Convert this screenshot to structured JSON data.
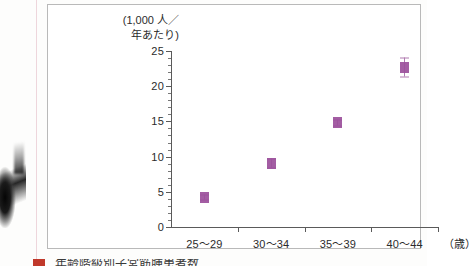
{
  "figure": {
    "y_unit_caption": "(1,000 人／\n年あたり)",
    "x_unit_caption": "（歳）"
  },
  "caption": {
    "marker": "",
    "text": "年齢階級別子宮筋腫患者数"
  },
  "chart_data": {
    "type": "scatter",
    "title": "",
    "xlabel": "（歳）",
    "ylabel": "(1,000 人／年あたり)",
    "categories": [
      "25〜29",
      "30〜34",
      "35〜39",
      "40〜44"
    ],
    "values": [
      4.2,
      9.0,
      14.8,
      22.6
    ],
    "error_low": [
      3.8,
      8.4,
      14.4,
      21.3
    ],
    "error_high": [
      4.6,
      9.7,
      15.2,
      24.0
    ],
    "ylim": [
      0,
      25
    ],
    "y_major_ticks": [
      0,
      5,
      10,
      15,
      20,
      25
    ],
    "y_tick_labels": [
      "0",
      "5",
      "10",
      "15",
      "20",
      "25"
    ],
    "y_minor_tick_step": 1,
    "grid": false,
    "legend": "none",
    "marker_color": "#9b4f9b",
    "errorbar_color": "#b07ab0",
    "axis_color": "#5a5a5a"
  }
}
